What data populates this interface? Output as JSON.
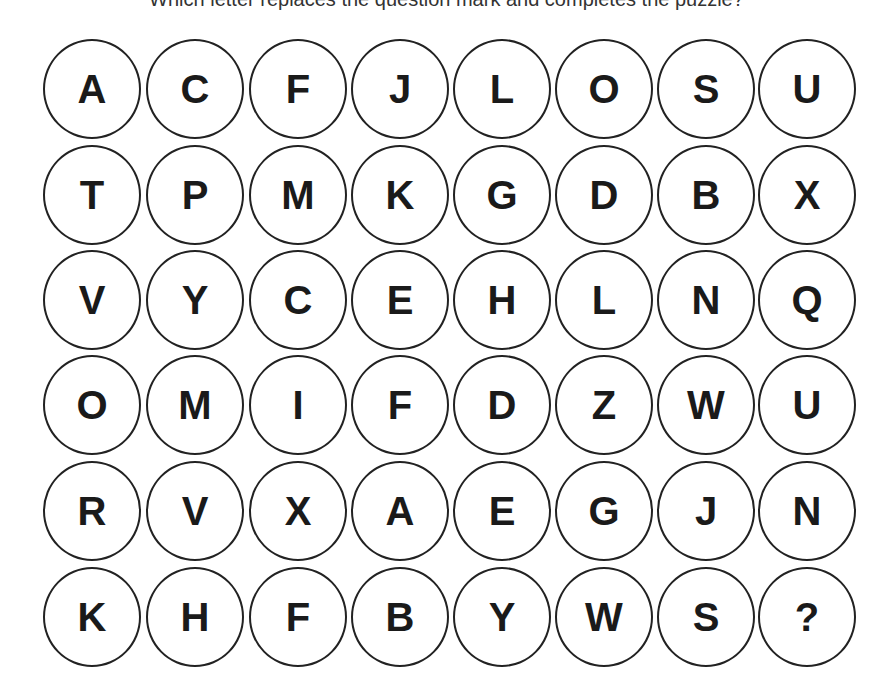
{
  "question": "Which letter replaces the question mark and completes the puzzle?",
  "grid": {
    "rows": [
      [
        "A",
        "C",
        "F",
        "J",
        "L",
        "O",
        "S",
        "U"
      ],
      [
        "T",
        "P",
        "M",
        "K",
        "G",
        "D",
        "B",
        "X"
      ],
      [
        "V",
        "Y",
        "C",
        "E",
        "H",
        "L",
        "N",
        "Q"
      ],
      [
        "O",
        "M",
        "I",
        "F",
        "D",
        "Z",
        "W",
        "U"
      ],
      [
        "R",
        "V",
        "X",
        "A",
        "E",
        "G",
        "J",
        "N"
      ],
      [
        "K",
        "H",
        "F",
        "B",
        "Y",
        "W",
        "S",
        "?"
      ]
    ]
  }
}
